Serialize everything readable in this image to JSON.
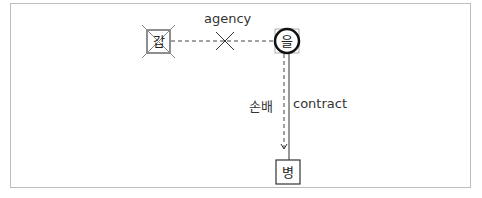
{
  "diagram": {
    "nodes": [
      {
        "id": "gap",
        "label": "갑",
        "shape": "square",
        "crossed_out": true
      },
      {
        "id": "eul",
        "label": "을",
        "shape": "circle",
        "emphasized": true
      },
      {
        "id": "byeong",
        "label": "병",
        "shape": "square",
        "crossed_out": false
      }
    ],
    "edges": [
      {
        "from": "gap",
        "to": "eul",
        "label": "agency",
        "style": "dashed",
        "negated": true
      },
      {
        "from": "eul",
        "to": "byeong",
        "left_label": "손배",
        "right_label": "contract",
        "style": "dashed+solid",
        "arrow": "down"
      }
    ]
  },
  "colors": {
    "frame_border": "#bdbdbd",
    "line": "#333333",
    "cross": "#555555"
  }
}
